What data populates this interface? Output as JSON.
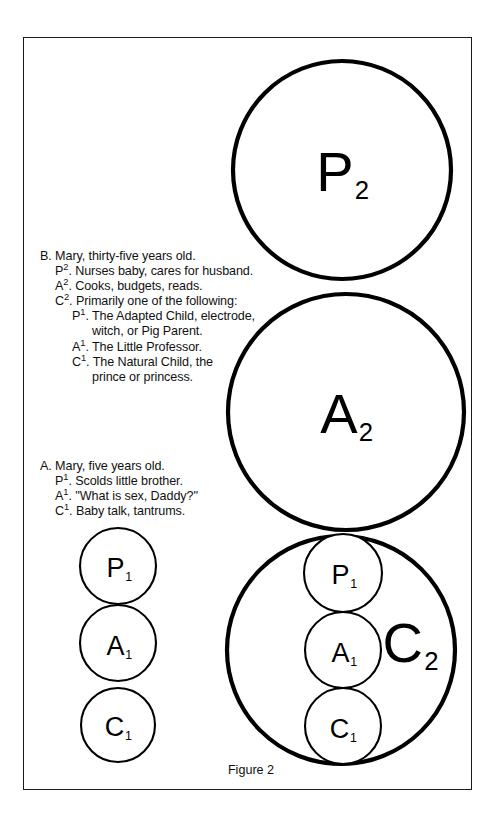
{
  "figure": {
    "caption": "Figure 2",
    "border_color": "#1a1a1a",
    "ink_color": "#000000"
  },
  "diagram": {
    "structures": [
      {
        "name": "second-order-stack",
        "circles": [
          {
            "id": "P2",
            "letter": "P",
            "subscript": "2",
            "size": "big"
          },
          {
            "id": "A2",
            "letter": "A",
            "subscript": "2",
            "size": "big"
          },
          {
            "id": "C2",
            "letter": "C",
            "subscript": "2",
            "size": "big"
          }
        ]
      },
      {
        "name": "first-order-stack-left",
        "circles": [
          {
            "id": "P1-left",
            "letter": "P",
            "subscript": "1",
            "size": "small"
          },
          {
            "id": "A1-left",
            "letter": "A",
            "subscript": "1",
            "size": "small"
          },
          {
            "id": "C1-left",
            "letter": "C",
            "subscript": "1",
            "size": "small"
          }
        ]
      },
      {
        "name": "first-order-stack-inside-C2",
        "circles": [
          {
            "id": "P1-inner",
            "letter": "P",
            "subscript": "1",
            "size": "small"
          },
          {
            "id": "A1-inner",
            "letter": "A",
            "subscript": "1",
            "size": "small"
          },
          {
            "id": "C1-inner",
            "letter": "C",
            "subscript": "1",
            "size": "small"
          }
        ]
      }
    ]
  },
  "annotations": {
    "section_b": {
      "id": "B",
      "lines": [
        {
          "level": 0,
          "marker": "B.",
          "sup": "",
          "text": "Mary, thirty-five years old."
        },
        {
          "level": 1,
          "marker": "P",
          "sup": "2",
          "text": ". Nurses baby, cares for husband."
        },
        {
          "level": 1,
          "marker": "A",
          "sup": "2",
          "text": ". Cooks, budgets, reads."
        },
        {
          "level": 1,
          "marker": "C",
          "sup": "2",
          "text": ". Primarily one of the following:"
        },
        {
          "level": 2,
          "marker": "P",
          "sup": "1",
          "text": ". The Adapted Child, electrode,"
        },
        {
          "level": 3,
          "marker": "",
          "sup": "",
          "text": "witch, or Pig Parent."
        },
        {
          "level": 2,
          "marker": "A",
          "sup": "1",
          "text": ". The Little Professor."
        },
        {
          "level": 2,
          "marker": "C",
          "sup": "1",
          "text": ". The Natural Child, the"
        },
        {
          "level": 3,
          "marker": "",
          "sup": "",
          "text": "prince or princess."
        }
      ]
    },
    "section_a": {
      "id": "A",
      "lines": [
        {
          "level": 0,
          "marker": "A.",
          "sup": "",
          "text": "Mary, five years old."
        },
        {
          "level": 1,
          "marker": "P",
          "sup": "1",
          "text": ". Scolds little brother."
        },
        {
          "level": 1,
          "marker": "A",
          "sup": "1",
          "text": ". ''What is sex, Daddy?''"
        },
        {
          "level": 1,
          "marker": "C",
          "sup": "1",
          "text": ". Baby talk, tantrums."
        }
      ]
    }
  },
  "labels": {
    "P2": {
      "letter": "P",
      "sub": "2"
    },
    "A2": {
      "letter": "A",
      "sub": "2"
    },
    "C2": {
      "letter": "C",
      "sub": "2"
    },
    "P1_left": {
      "letter": "P",
      "sub": "1"
    },
    "A1_left": {
      "letter": "A",
      "sub": "1"
    },
    "C1_left": {
      "letter": "C",
      "sub": "1"
    },
    "P1_inner": {
      "letter": "P",
      "sub": "1"
    },
    "A1_inner": {
      "letter": "A",
      "sub": "1"
    },
    "C1_inner": {
      "letter": "C",
      "sub": "1"
    }
  }
}
